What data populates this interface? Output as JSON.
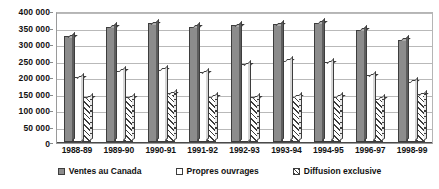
{
  "chart_data": {
    "type": "bar",
    "title": "",
    "subtitle": "",
    "xlabel": "",
    "ylabel": "",
    "ylim": [
      0,
      400000
    ],
    "ytick_step": 50000,
    "ytick_labels": [
      "400 000",
      "350 000",
      "300 000",
      "250 000",
      "200 000",
      "150 000",
      "100 000",
      "50 000",
      "0"
    ],
    "ytick_values": [
      400000,
      350000,
      300000,
      250000,
      200000,
      150000,
      100000,
      50000,
      0
    ],
    "grid": true,
    "grid_axis": "y",
    "legend_position": "bottom",
    "style": "3d-bar-grayscale",
    "categories": [
      "1988-89",
      "1989-90",
      "1990-91",
      "1991-92",
      "1992-93",
      "1993-94",
      "1994-95",
      "1996-97",
      "1998-99"
    ],
    "series": [
      {
        "name": "Ventes au Canada",
        "swatch": "solid-gray",
        "color": "#8c8c8c",
        "values": [
          325000,
          355000,
          365000,
          355000,
          360000,
          363000,
          367000,
          345000,
          315000
        ]
      },
      {
        "name": "Propres ouvrages",
        "swatch": "white-outline",
        "color": "#ffffff",
        "values": [
          200000,
          220000,
          222000,
          215000,
          240000,
          250000,
          245000,
          205000,
          185000
        ]
      },
      {
        "name": "Diffusion exclusive",
        "swatch": "diagonal-hatch",
        "color": "#ffffff",
        "values": [
          137000,
          137000,
          150000,
          140000,
          137000,
          140000,
          140000,
          133000,
          147000
        ]
      }
    ]
  },
  "legend": {
    "items": [
      {
        "label": "Ventes au Canada"
      },
      {
        "label": "Propres ouvrages"
      },
      {
        "label": "Diffusion exclusive"
      }
    ]
  }
}
